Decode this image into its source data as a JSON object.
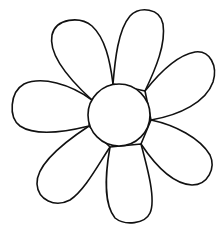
{
  "image": {
    "subject": "flower line drawing",
    "petal_count": 7,
    "stroke_color": "#111111",
    "fill_color": "#ffffff",
    "background": "#ffffff"
  }
}
